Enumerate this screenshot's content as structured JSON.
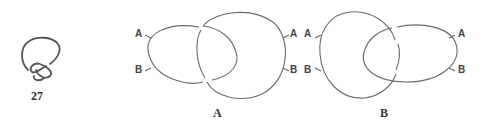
{
  "knot": {
    "number": "27"
  },
  "diagram_a": {
    "caption": "A",
    "left_labels": {
      "top": "A",
      "bottom": "B"
    },
    "right_labels": {
      "top": "A",
      "bottom": "B"
    }
  },
  "diagram_b": {
    "caption": "B",
    "left_labels": {
      "top": "A",
      "bottom": "B"
    },
    "right_labels": {
      "top": "A",
      "bottom": "B"
    }
  },
  "colors": {
    "line": "#6a6a6a",
    "text": "#444444"
  }
}
